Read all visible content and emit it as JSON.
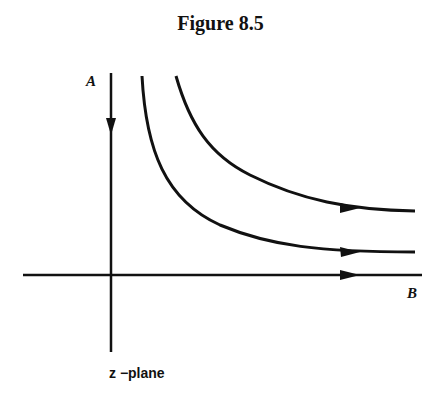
{
  "figure": {
    "title": "Figure 8.5",
    "axis_labels": {
      "vertical": "A",
      "horizontal": "B"
    },
    "caption": "z −plane",
    "ink_color": "#111111",
    "background": "#ffffff"
  },
  "diagram": {
    "streamlines": [
      {
        "name": "vertical-axis-flow",
        "direction": "down"
      },
      {
        "name": "inner-curve",
        "direction": "right"
      },
      {
        "name": "outer-curve",
        "direction": "right"
      },
      {
        "name": "horizontal-axis-flow",
        "direction": "right"
      }
    ]
  }
}
